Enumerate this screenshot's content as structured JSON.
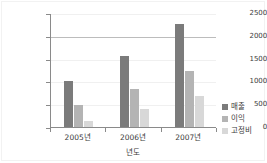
{
  "chart_data": {
    "type": "bar",
    "title": "",
    "xlabel": "년도",
    "ylabel": "",
    "categories": [
      "2005년",
      "2006년",
      "2007년"
    ],
    "series": [
      {
        "name": "매출",
        "color": "#7b7b7b",
        "values": [
          1000,
          1550,
          2270
        ]
      },
      {
        "name": "이익",
        "color": "#b4b4b4",
        "values": [
          480,
          840,
          1230
        ]
      },
      {
        "name": "고정비",
        "color": "#d8d8d8",
        "values": [
          130,
          400,
          670
        ]
      }
    ],
    "ylim": [
      0,
      2500
    ],
    "yticks": [
      0,
      500,
      1000,
      1500,
      2000,
      2500
    ],
    "ytick_labels": [
      "0",
      "500",
      "1000",
      "1500",
      "2000",
      "2500"
    ],
    "grid": true,
    "grid_emphasis_value": 2000,
    "legend_position": "right"
  },
  "colors": {
    "axis": "#8a8a8a",
    "gridline": "#bcbcbc",
    "text": "#3b3b3b",
    "background": "#ffffff"
  }
}
